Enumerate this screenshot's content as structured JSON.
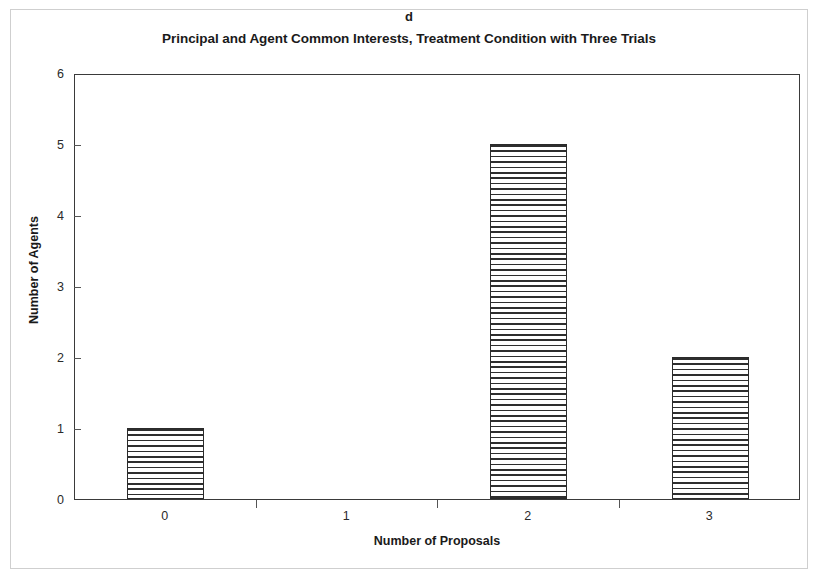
{
  "figure": {
    "panel_letter": "d",
    "frame_color": "#cfcfcf",
    "axis_color": "#3a3a3a",
    "bar_edge_color": "#2b2b2b",
    "bar_hatch_color": "#2e2e2e"
  },
  "chart_data": {
    "type": "bar",
    "title": "Principal and Agent Common Interests, Treatment Condition with Three Trials",
    "panel_label": "d",
    "xlabel": "Number of Proposals",
    "ylabel": "Number of Agents",
    "categories": [
      "0",
      "1",
      "2",
      "3"
    ],
    "values": [
      1,
      0,
      5,
      2
    ],
    "ylim": [
      0,
      6
    ],
    "yticks": [
      "0",
      "1",
      "2",
      "3",
      "4",
      "5",
      "6"
    ],
    "ytick_values": [
      0,
      1,
      2,
      3,
      4,
      5,
      6
    ],
    "xtick_labels": [
      "0",
      "1",
      "2",
      "3"
    ],
    "grid": false,
    "legend": null,
    "bar_fill": "horizontal-hatch",
    "series": [
      {
        "name": "Number of Agents",
        "values": [
          1,
          0,
          5,
          2
        ]
      }
    ]
  }
}
